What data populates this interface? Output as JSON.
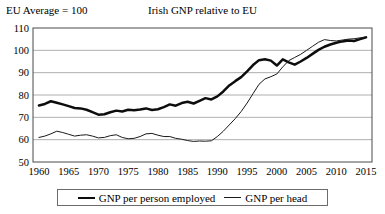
{
  "header": {
    "note": "EU Average = 100",
    "title": "Irish GNP relative to EU"
  },
  "legend": {
    "entries": [
      {
        "label": "GNP per person employed",
        "style": "thick"
      },
      {
        "label": "GNP per head",
        "style": "thin"
      }
    ]
  },
  "chart_data": {
    "type": "line",
    "title": "Irish GNP relative to EU",
    "subtitle": "EU Average = 100",
    "xlabel": "",
    "ylabel": "",
    "xlim": [
      1959,
      2016
    ],
    "ylim": [
      50,
      110
    ],
    "yticks": [
      50,
      60,
      70,
      80,
      90,
      100,
      110
    ],
    "xticks": [
      1960,
      1965,
      1970,
      1975,
      1980,
      1985,
      1990,
      1995,
      2000,
      2005,
      2010,
      2015
    ],
    "grid": "horizontal",
    "legend_position": "bottom",
    "x": [
      1960,
      1961,
      1962,
      1963,
      1964,
      1965,
      1966,
      1967,
      1968,
      1969,
      1970,
      1971,
      1972,
      1973,
      1974,
      1975,
      1976,
      1977,
      1978,
      1979,
      1980,
      1981,
      1982,
      1983,
      1984,
      1985,
      1986,
      1987,
      1988,
      1989,
      1990,
      1991,
      1992,
      1993,
      1994,
      1995,
      1996,
      1997,
      1998,
      1999,
      2000,
      2001,
      2002,
      2003,
      2004,
      2005,
      2006,
      2007,
      2008,
      2009,
      2010,
      2011,
      2012,
      2013,
      2014,
      2015
    ],
    "series": [
      {
        "name": "GNP per person employed",
        "style": "thick",
        "values": [
          75.3,
          76.0,
          77.2,
          76.5,
          75.8,
          75.0,
          74.2,
          74.0,
          73.4,
          72.3,
          71.2,
          71.4,
          72.3,
          73.0,
          72.6,
          73.4,
          73.2,
          73.5,
          74.0,
          73.3,
          73.6,
          74.6,
          75.8,
          75.2,
          76.4,
          77.0,
          76.2,
          77.4,
          78.6,
          78.0,
          79.4,
          81.6,
          84.3,
          86.2,
          88.0,
          90.6,
          93.4,
          95.6,
          96.0,
          95.4,
          93.2,
          96.0,
          94.6,
          93.6,
          95.0,
          96.6,
          98.4,
          100.2,
          101.6,
          102.6,
          103.4,
          104.0,
          104.4,
          104.2,
          105.0,
          105.8
        ]
      },
      {
        "name": "GNP per head",
        "style": "thin",
        "values": [
          61.0,
          61.6,
          62.6,
          63.8,
          63.2,
          62.4,
          61.6,
          62.0,
          62.2,
          61.6,
          60.8,
          61.0,
          61.8,
          62.2,
          61.0,
          60.4,
          60.6,
          61.4,
          62.6,
          62.8,
          62.0,
          61.4,
          61.4,
          60.6,
          60.2,
          59.6,
          59.2,
          59.4,
          59.3,
          59.5,
          61.4,
          63.8,
          66.6,
          69.4,
          72.6,
          76.4,
          80.6,
          84.8,
          87.2,
          88.2,
          89.4,
          92.6,
          95.4,
          96.8,
          98.2,
          100.0,
          101.8,
          103.6,
          104.8,
          104.4,
          104.2,
          104.6,
          105.0,
          105.2,
          105.6,
          106.0
        ]
      }
    ]
  }
}
